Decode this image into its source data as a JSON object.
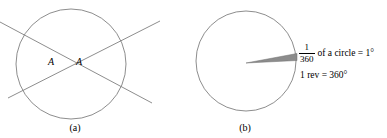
{
  "figure": {
    "width": 387,
    "height": 138,
    "background": "#ffffff",
    "stroke_color": "#808080",
    "wedge_fill": "#8c8c8c",
    "text_color": "#000000"
  },
  "panel_a": {
    "caption": "(a)",
    "circle": {
      "cx": 71,
      "cy": 64,
      "r": 55
    },
    "intersection": {
      "x": 66,
      "y": 62
    },
    "vertex_labels": [
      {
        "text": "A",
        "position": "left-of-intersection"
      },
      {
        "text": "A",
        "position": "right-of-intersection"
      }
    ],
    "lines": [
      {
        "name": "line-down-right",
        "x1": 0,
        "y1": 22,
        "x2": 152,
        "y2": 103
      },
      {
        "name": "line-up-right",
        "x1": 8,
        "y1": 98,
        "x2": 160,
        "y2": 21
      }
    ]
  },
  "panel_b": {
    "caption": "(b)",
    "circle": {
      "cx": 53,
      "cy": 61,
      "r": 50
    },
    "wedge": {
      "name": "one-degree-sector",
      "apex": {
        "x": 53,
        "y": 63
      },
      "tip_top": {
        "x": 104,
        "y": 54
      },
      "tip_bottom": {
        "x": 104,
        "y": 60
      }
    },
    "annotation": {
      "line1": {
        "fraction_numerator": "1",
        "fraction_denominator": "360",
        "text": "of a circle = 1°"
      },
      "line2": {
        "text": "1 rev = 360°"
      }
    }
  }
}
